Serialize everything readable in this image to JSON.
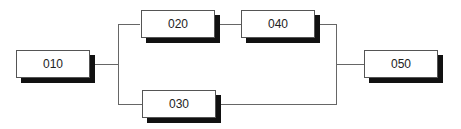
{
  "diagram": {
    "type": "network-precedence",
    "nodes": [
      {
        "id": "010",
        "label": "010"
      },
      {
        "id": "020",
        "label": "020"
      },
      {
        "id": "030",
        "label": "030"
      },
      {
        "id": "040",
        "label": "040"
      },
      {
        "id": "050",
        "label": "050"
      }
    ],
    "edges": [
      {
        "from": "010",
        "to": "020"
      },
      {
        "from": "010",
        "to": "030"
      },
      {
        "from": "020",
        "to": "040"
      },
      {
        "from": "040",
        "to": "050"
      },
      {
        "from": "030",
        "to": "050"
      }
    ]
  }
}
